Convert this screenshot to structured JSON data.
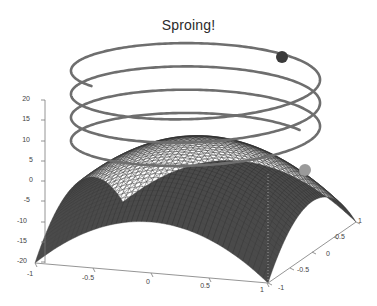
{
  "figure": {
    "title": "Sproing!",
    "background_color": "#ffffff",
    "width": 377,
    "height": 306
  },
  "chart_data": {
    "type": "line",
    "title": "Sproing!",
    "xlabel": "",
    "ylabel": "",
    "zlabel": "",
    "grid": false,
    "legend": "none",
    "projection": "3d",
    "axes": {
      "x": {
        "ticks": [
          "-1",
          "-0.5",
          "0",
          "0.5",
          "1"
        ],
        "values": [
          -1,
          -0.5,
          0,
          0.5,
          1
        ],
        "lim": [
          -1,
          1
        ]
      },
      "y": {
        "ticks": [
          "-1",
          "-0.5",
          "0",
          "0.5",
          "1"
        ],
        "values": [
          -1,
          -0.5,
          0,
          0.5,
          1
        ],
        "lim": [
          -1,
          1
        ]
      },
      "z": {
        "ticks": [
          "20",
          "15",
          "10",
          "5",
          "0",
          "-5",
          "-10",
          "-15",
          "-20"
        ],
        "values": [
          20,
          15,
          10,
          5,
          0,
          -5,
          -10,
          -15,
          -20
        ],
        "lim": [
          -20,
          20
        ]
      }
    },
    "series": [
      {
        "name": "spring-helix",
        "type": "line3d",
        "color": "#6e6e6e",
        "linewidth": 2.6,
        "turns": 3.5,
        "radius": 1.0,
        "z_start": 3,
        "z_end": 23,
        "description": "helical spring coil above the surface"
      },
      {
        "name": "surface-mesh",
        "type": "surface",
        "colormap": "gray",
        "z_center": 5,
        "z_corner": -20,
        "description": "dark saddle/dome mesh surface spanning x and y from -1 to 1"
      }
    ],
    "markers": [
      {
        "name": "spring-top-end",
        "x": 282,
        "y": 57,
        "radius": 6,
        "color": "#3a3a3a"
      },
      {
        "name": "spring-bottom-end",
        "x": 305,
        "y": 170,
        "radius": 6,
        "color": "#9a9a9a"
      }
    ]
  },
  "axis_labels": {
    "z": [
      {
        "text": "20",
        "x": 30,
        "y": 101
      },
      {
        "text": "15",
        "x": 30,
        "y": 121
      },
      {
        "text": "10",
        "x": 30,
        "y": 142
      },
      {
        "text": "5",
        "x": 33,
        "y": 162
      },
      {
        "text": "0",
        "x": 33,
        "y": 182
      },
      {
        "text": "-5",
        "x": 30,
        "y": 202
      },
      {
        "text": "-10",
        "x": 27,
        "y": 223
      },
      {
        "text": "-15",
        "x": 27,
        "y": 243
      },
      {
        "text": "-20",
        "x": 27,
        "y": 263
      }
    ],
    "x": [
      {
        "text": "-1",
        "x": 30,
        "y": 276
      },
      {
        "text": "-0.5",
        "x": 88,
        "y": 280
      },
      {
        "text": "0",
        "x": 148,
        "y": 284
      },
      {
        "text": "0.5",
        "x": 205,
        "y": 288
      },
      {
        "text": "1",
        "x": 262,
        "y": 292
      }
    ],
    "y": [
      {
        "text": "-1",
        "x": 281,
        "y": 290
      },
      {
        "text": "-0.5",
        "x": 303,
        "y": 272
      },
      {
        "text": "0",
        "x": 328,
        "y": 256
      },
      {
        "text": "0.5",
        "x": 340,
        "y": 239
      },
      {
        "text": "1",
        "x": 360,
        "y": 223
      }
    ]
  }
}
